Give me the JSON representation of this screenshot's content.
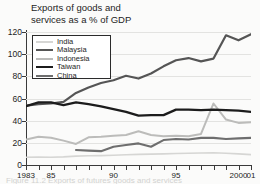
{
  "chart_data": {
    "type": "line",
    "title": "Exports of goods and\nservices as a % of GDP",
    "title_line1": "Exports of goods and",
    "title_line2": "services as a % of GDP",
    "xlabel": "",
    "ylabel": "",
    "ylim": [
      0,
      120
    ],
    "xlim": [
      1983,
      2001
    ],
    "yticks": [
      0,
      20,
      40,
      60,
      80,
      100,
      120
    ],
    "grid": true,
    "legend_position": "upper-left-inside",
    "x": [
      1983,
      1984,
      1985,
      1986,
      1987,
      1988,
      1989,
      1990,
      1991,
      1992,
      1993,
      1994,
      1995,
      1996,
      1997,
      1998,
      1999,
      2000,
      2001
    ],
    "xtick_labels": [
      {
        "year": 1983,
        "label": "1983"
      },
      {
        "year": 1985,
        "label": "85"
      },
      {
        "year": 1990,
        "label": "90"
      },
      {
        "year": 1995,
        "label": "95"
      },
      {
        "year": 2000,
        "label": "2000"
      },
      {
        "year": 2001,
        "label": "01"
      }
    ],
    "series": [
      {
        "name": "India",
        "color": "#d6d6d4",
        "width": 1.6,
        "values": [
          7.0,
          7.2,
          7.0,
          7.3,
          8.0,
          8.3,
          8.5,
          8.8,
          9.3,
          9.6,
          9.8,
          10.0,
          10.4,
          10.6,
          10.8,
          11.0,
          10.6,
          10.0,
          9.4
        ]
      },
      {
        "name": "Malaysia",
        "color": "#555555",
        "width": 2.2,
        "values": [
          53.5,
          55.0,
          55.5,
          57.0,
          65.0,
          70.0,
          74.0,
          76.5,
          80.5,
          78.0,
          82.5,
          89.0,
          94.5,
          96.5,
          93.5,
          96.0,
          117.0,
          112.5,
          118.0
        ]
      },
      {
        "name": "Indonesia",
        "color": "#bcbcba",
        "width": 2.0,
        "values": [
          23.0,
          25.5,
          24.5,
          22.0,
          19.0,
          25.0,
          25.5,
          26.5,
          27.0,
          30.5,
          27.0,
          26.0,
          26.5,
          26.0,
          28.0,
          55.5,
          41.0,
          38.0,
          38.5
        ]
      },
      {
        "name": "Taiwan",
        "color": "#1c1c1c",
        "width": 2.3,
        "values": [
          53.0,
          56.5,
          56.5,
          54.0,
          56.5,
          55.0,
          53.0,
          50.5,
          48.0,
          44.5,
          45.0,
          45.0,
          50.0,
          50.0,
          49.5,
          50.0,
          49.5,
          49.0,
          48.0
        ]
      },
      {
        "name": "China",
        "color": "#6e6e6e",
        "width": 2.1,
        "values": [
          null,
          null,
          null,
          null,
          13.5,
          13.0,
          12.5,
          16.5,
          18.0,
          19.5,
          16.5,
          22.5,
          23.5,
          23.0,
          24.5,
          24.5,
          23.5,
          24.0,
          24.5
        ]
      }
    ],
    "legend_entries": [
      {
        "label": "India",
        "color": "#d6d6d4"
      },
      {
        "label": "Malaysia",
        "color": "#555555"
      },
      {
        "label": "Indonesia",
        "color": "#bcbcba"
      },
      {
        "label": "Taiwan",
        "color": "#1c1c1c"
      },
      {
        "label": "China",
        "color": "#6e6e6e"
      }
    ],
    "caption_cropped": "Figure 11.2  Exports of futures goods and services"
  }
}
